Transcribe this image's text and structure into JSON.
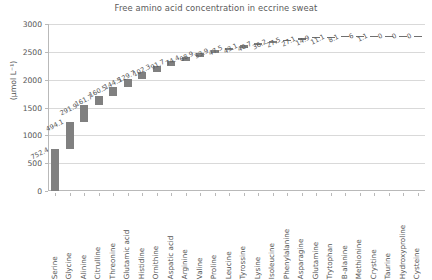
{
  "chart_data": {
    "type": "bar",
    "subtype": "waterfall",
    "title": "Free amino acid concentration in eccrine sweat",
    "xlabel": "",
    "ylabel": "(µmol L⁻¹)",
    "ylim": [
      0,
      3000
    ],
    "yticks": [
      0,
      500,
      1000,
      1500,
      2000,
      2500,
      3000
    ],
    "ytick_labels": [
      "0",
      "500",
      "1000",
      "1500",
      "2000",
      "2500",
      "3000"
    ],
    "grid": true,
    "legend": "none",
    "bar_color": "#808080",
    "categories": [
      "Serine",
      "Glycine",
      "Alinine",
      "Citrulline",
      "Threonine",
      "Glutamic acid",
      "Histidine",
      "Ornithine",
      "Aspatic acid",
      "Arginine",
      "Valine",
      "Proline",
      "Leucine",
      "Tyrossine",
      "Lysine",
      "Isoleucine",
      "Phenylalanine",
      "Asparagine",
      "Glutamine",
      "Trytophan",
      "B-alanine",
      "Methionine",
      "Crystine",
      "Taurine",
      "Hydroxyproline",
      "Cysteine"
    ],
    "values": [
      752.4,
      494.1,
      291.9,
      161.7,
      160.5,
      144.5,
      129.7,
      102.3,
      91.7,
      74.4,
      68.9,
      53.9,
      47.5,
      43.1,
      40.7,
      36.2,
      27.5,
      27.1,
      14.9,
      11.1,
      8.1,
      6,
      1.1,
      0,
      0,
      0
    ],
    "value_labels": [
      "752.4",
      "494.1",
      "291.9",
      "161.7",
      "160.5",
      "144.5",
      "129.7",
      "102.3",
      "91.7",
      "74.4",
      "68.9",
      "53.9",
      "47.5",
      "43.1",
      "40.7",
      "36.2",
      "27.5",
      "27.1",
      "14.9",
      "11.1",
      "8.1",
      "6",
      "1.1",
      "0",
      "0",
      "0"
    ],
    "cumulative_start": [
      0,
      752.4,
      1246.5,
      1538.4,
      1700.1,
      1860.6,
      2005.1,
      2134.8,
      2237.1,
      2328.8,
      2403.2,
      2472.1,
      2526.0,
      2573.5,
      2616.6,
      2657.3,
      2693.5,
      2721.0,
      2748.1,
      2763.0,
      2774.1,
      2782.2,
      2788.2,
      2789.3,
      2789.3,
      2789.3
    ],
    "cumulative_total": 2789.3
  }
}
